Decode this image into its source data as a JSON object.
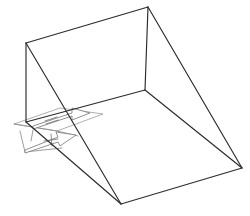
{
  "figure": {
    "background_color": "#ffffff",
    "edge_color": "#2b2b2b",
    "annotation_color": "#8c8c8c",
    "caption": "",
    "view": "isometric",
    "canvas": {
      "width": 250,
      "height": 216
    }
  },
  "geometry": {
    "vertices": {
      "back_top_left": {
        "label": "A",
        "x": 26,
        "y": 43
      },
      "back_top_right": {
        "label": "B",
        "x": 148,
        "y": 7
      },
      "back_bottom_inner": {
        "label": "C",
        "x": 145,
        "y": 90
      },
      "left_bottom": {
        "label": "D",
        "x": 26,
        "y": 122
      },
      "right_far": {
        "label": "E",
        "x": 242,
        "y": 168
      },
      "front_apex": {
        "label": "F",
        "x": 121,
        "y": 204
      }
    },
    "edges": [
      {
        "name": "back-wall-top",
        "from": "A",
        "to": "B"
      },
      {
        "name": "back-wall-right-vertical",
        "from": "B",
        "to": "C"
      },
      {
        "name": "back-wall-bottom",
        "from": "C",
        "to": "D"
      },
      {
        "name": "back-wall-left-vertical",
        "from": "A",
        "to": "D"
      },
      {
        "name": "incline-ridge-left",
        "from": "A",
        "to": "F"
      },
      {
        "name": "incline-ridge-right",
        "from": "B",
        "to": "E"
      },
      {
        "name": "floor-inner-diagonal",
        "from": "C",
        "to": "E"
      },
      {
        "name": "base-front-left",
        "from": "D",
        "to": "F"
      },
      {
        "name": "base-front-right",
        "from": "F",
        "to": "E"
      }
    ],
    "faces": [
      {
        "name": "back-wall",
        "vertices": [
          "A",
          "B",
          "C",
          "D"
        ]
      },
      {
        "name": "inclined-ramp",
        "vertices": [
          "A",
          "B",
          "E",
          "F"
        ]
      },
      {
        "name": "right-triangular-side",
        "vertices": [
          "B",
          "C",
          "E"
        ]
      },
      {
        "name": "base-floor",
        "vertices": [
          "D",
          "C",
          "E",
          "F"
        ]
      }
    ]
  },
  "annotations": {
    "reference_plane": {
      "name": "dimension-reference-plane",
      "points": [
        [
          14,
          124
        ],
        [
          60,
          108
        ],
        [
          103,
          114
        ],
        [
          57,
          131
        ]
      ]
    },
    "arrows": [
      {
        "name": "upper-direction-arrow",
        "label": "",
        "tail": {
          "x": 33,
          "y": 124
        },
        "head": {
          "x": 84,
          "y": 110
        },
        "body_points": [
          [
            33,
            126
          ],
          [
            72,
            113
          ],
          [
            72,
            108
          ],
          [
            90,
            113
          ],
          [
            72,
            120
          ],
          [
            72,
            116
          ],
          [
            33,
            129
          ]
        ],
        "tick_mark": {
          "x1": 46,
          "y1": 120,
          "x2": 56,
          "y2": 117
        }
      },
      {
        "name": "lower-direction-arrow",
        "label": "",
        "tail": {
          "x": 25,
          "y": 148
        },
        "head": {
          "x": 73,
          "y": 131
        },
        "body_points": [
          [
            25,
            150
          ],
          [
            58,
            137
          ],
          [
            56,
            132
          ],
          [
            76,
            135
          ],
          [
            60,
            146
          ],
          [
            58,
            142
          ],
          [
            25,
            153
          ]
        ],
        "tick_mark": {
          "x1": 48,
          "y1": 138,
          "x2": 54,
          "y2": 147
        }
      }
    ],
    "leader_lines": [
      {
        "name": "leader-upper",
        "x1": 28,
        "y1": 122,
        "x2": 103,
        "y2": 114
      },
      {
        "name": "leader-lower",
        "x1": 20,
        "y1": 130,
        "x2": 70,
        "y2": 147
      }
    ]
  }
}
